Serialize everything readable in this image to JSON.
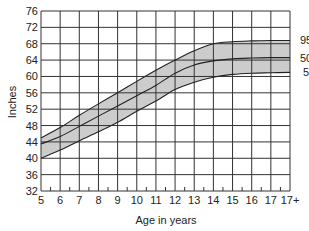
{
  "chart_data": {
    "type": "line",
    "title": "",
    "xlabel": "Age in years",
    "ylabel": "Inches",
    "x_ticks": [
      "5",
      "6",
      "7",
      "8",
      "9",
      "10",
      "11",
      "12",
      "13",
      "14",
      "15",
      "16",
      "17",
      "17+"
    ],
    "y_ticks": [
      32,
      36,
      40,
      44,
      48,
      52,
      56,
      60,
      64,
      68,
      72,
      76
    ],
    "ylim": [
      32,
      76
    ],
    "grid": true,
    "legend_position": "right-inline",
    "band": {
      "lower": "5",
      "upper": "95",
      "color": "#cccccc"
    },
    "x": [
      5,
      6,
      7,
      8,
      9,
      10,
      11,
      12,
      13,
      14,
      15,
      16,
      17,
      18
    ],
    "series": [
      {
        "name": "95",
        "values": [
          45.0,
          47.5,
          50.5,
          53.3,
          56.0,
          58.8,
          61.5,
          64.0,
          66.3,
          68.0,
          68.5,
          68.7,
          68.8,
          68.8
        ]
      },
      {
        "name": "50",
        "values": [
          43.5,
          45.3,
          47.8,
          50.3,
          52.8,
          55.3,
          57.8,
          60.8,
          62.8,
          63.8,
          64.3,
          64.5,
          64.6,
          64.6
        ]
      },
      {
        "name": "5",
        "values": [
          40.0,
          42.0,
          44.3,
          46.5,
          48.8,
          51.5,
          54.0,
          56.8,
          58.6,
          59.8,
          60.5,
          60.8,
          60.9,
          61.0
        ]
      }
    ],
    "series_labels": [
      "95",
      "50",
      "5"
    ]
  },
  "colors": {
    "band": "#cccccc",
    "line": "#222222",
    "grid": "#333333"
  }
}
